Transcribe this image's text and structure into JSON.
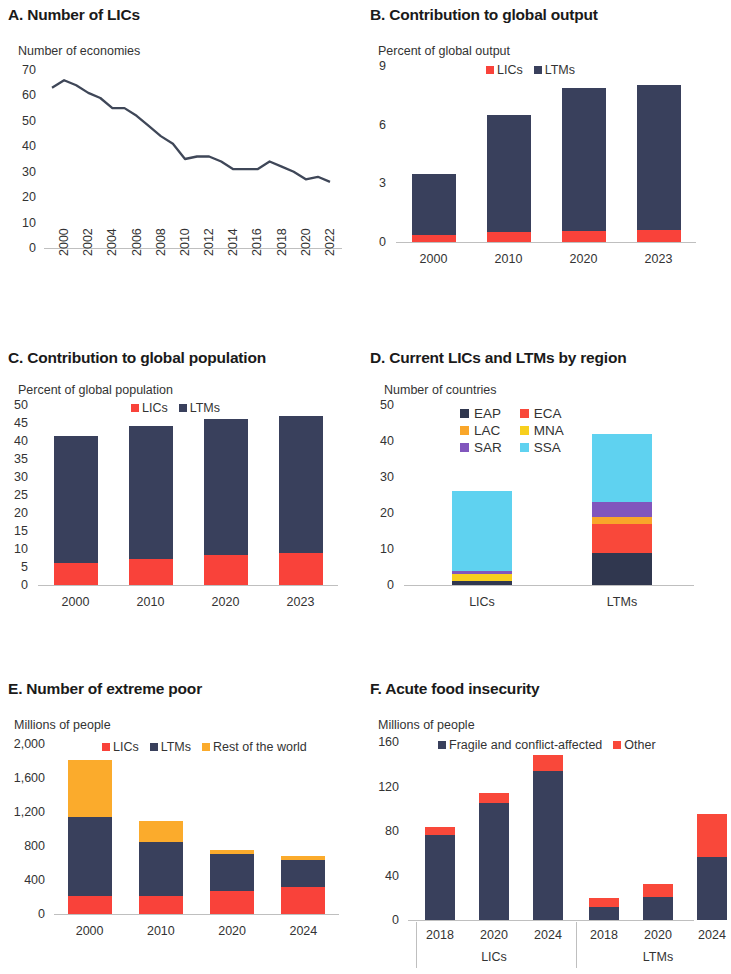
{
  "figure": {
    "colors": {
      "lics": "#f9423a",
      "ltms": "#39405c",
      "rest_of_world": "#fbab2c",
      "eap": "#30374f",
      "eca": "#f9483a",
      "lac": "#f9a62a",
      "mna": "#f7cf1e",
      "sar": "#8156bd",
      "ssa": "#5fd2f0",
      "fragile": "#39405c",
      "other": "#f9483a",
      "axis": "#bfbfbf",
      "line": "#3f4758"
    }
  },
  "panels": {
    "a": {
      "title": "A. Number of LICs",
      "axis_label": "Number of economies"
    },
    "b": {
      "title": "B. Contribution to global output",
      "axis_label": "Percent of global output"
    },
    "c": {
      "title": "C. Contribution to global population",
      "axis_label": "Percent of global population"
    },
    "d": {
      "title": "D. Current LICs and LTMs by region",
      "axis_label": "Number of countries"
    },
    "e": {
      "title": "E. Number of extreme poor",
      "axis_label": "Millions of people"
    },
    "f": {
      "title": "F. Acute food insecurity",
      "axis_label": "Millions of people"
    }
  },
  "chart_data": [
    {
      "id": "a",
      "type": "line",
      "title": "A. Number of LICs",
      "ylabel": "Number of economies",
      "xlabel": "",
      "ylim": [
        0,
        70
      ],
      "yticks": [
        0,
        10,
        20,
        30,
        40,
        50,
        60,
        70
      ],
      "ytick_labels": [
        "0",
        "10",
        "20",
        "30",
        "40",
        "50",
        "60",
        "70"
      ],
      "x": [
        2000,
        2001,
        2002,
        2003,
        2004,
        2005,
        2006,
        2007,
        2008,
        2009,
        2010,
        2011,
        2012,
        2013,
        2014,
        2015,
        2016,
        2017,
        2018,
        2019,
        2020,
        2021,
        2022,
        2023
      ],
      "xtick_labels": [
        "2000",
        "2002",
        "2004",
        "2006",
        "2008",
        "2010",
        "2012",
        "2014",
        "2016",
        "2018",
        "2020",
        "2022"
      ],
      "series": [
        {
          "name": "Number of LICs",
          "values": [
            63,
            66,
            64,
            61,
            59,
            55,
            55,
            52,
            48,
            44,
            41,
            35,
            36,
            36,
            34,
            31,
            31,
            31,
            34,
            32,
            30,
            27,
            28,
            26
          ]
        }
      ],
      "grid": false,
      "legend": "none"
    },
    {
      "id": "b",
      "type": "bar",
      "stacked": true,
      "title": "B. Contribution to global output",
      "ylabel": "Percent of global output",
      "xlabel": "",
      "ylim": [
        0,
        9
      ],
      "yticks": [
        0,
        3,
        6,
        9
      ],
      "ytick_labels": [
        "0",
        "3",
        "6",
        "9"
      ],
      "categories": [
        "2000",
        "2010",
        "2020",
        "2023"
      ],
      "series": [
        {
          "name": "LICs",
          "values": [
            0.35,
            0.5,
            0.55,
            0.6
          ]
        },
        {
          "name": "LTMs",
          "values": [
            3.15,
            6.0,
            7.35,
            7.45
          ]
        }
      ],
      "legend": [
        "LICs",
        "LTMs"
      ],
      "legend_position": "top-center",
      "grid": false
    },
    {
      "id": "c",
      "type": "bar",
      "stacked": true,
      "title": "C. Contribution to global population",
      "ylabel": "Percent of global population",
      "xlabel": "",
      "ylim": [
        0,
        50
      ],
      "yticks": [
        0,
        5,
        10,
        15,
        20,
        25,
        30,
        35,
        40,
        45,
        50
      ],
      "ytick_labels": [
        "0",
        "5",
        "10",
        "15",
        "20",
        "25",
        "30",
        "35",
        "40",
        "45",
        "50"
      ],
      "categories": [
        "2000",
        "2010",
        "2020",
        "2023"
      ],
      "series": [
        {
          "name": "LICs",
          "values": [
            6.0,
            7.2,
            8.4,
            8.8
          ]
        },
        {
          "name": "LTMs",
          "values": [
            35.5,
            37.0,
            37.8,
            38.2
          ]
        }
      ],
      "legend": [
        "LICs",
        "LTMs"
      ],
      "legend_position": "top-center",
      "grid": false
    },
    {
      "id": "d",
      "type": "bar",
      "stacked": true,
      "title": "D. Current LICs and LTMs by region",
      "ylabel": "Number of countries",
      "xlabel": "",
      "ylim": [
        0,
        50
      ],
      "yticks": [
        0,
        10,
        20,
        30,
        40,
        50
      ],
      "ytick_labels": [
        "0",
        "10",
        "20",
        "30",
        "40",
        "50"
      ],
      "categories": [
        "LICs",
        "LTMs"
      ],
      "series": [
        {
          "name": "EAP",
          "values": [
            1,
            9
          ]
        },
        {
          "name": "ECA",
          "values": [
            0,
            8
          ]
        },
        {
          "name": "LAC",
          "values": [
            0,
            2
          ]
        },
        {
          "name": "MNA",
          "values": [
            2,
            0
          ]
        },
        {
          "name": "SAR",
          "values": [
            1,
            4
          ]
        },
        {
          "name": "SSA",
          "values": [
            22,
            19
          ]
        }
      ],
      "legend": [
        "EAP",
        "ECA",
        "LAC",
        "MNA",
        "SAR",
        "SSA"
      ],
      "legend_position": "top-left-grid",
      "grid": false
    },
    {
      "id": "e",
      "type": "bar",
      "stacked": true,
      "title": "E. Number of extreme poor",
      "ylabel": "Millions of people",
      "xlabel": "",
      "ylim": [
        0,
        2000
      ],
      "yticks": [
        0,
        400,
        800,
        1200,
        1600,
        2000
      ],
      "ytick_labels": [
        "0",
        "400",
        "800",
        "1,200",
        "1,600",
        "2,000"
      ],
      "categories": [
        "2000",
        "2010",
        "2020",
        "2024"
      ],
      "series": [
        {
          "name": "LICs",
          "values": [
            215,
            215,
            265,
            315
          ]
        },
        {
          "name": "LTMs",
          "values": [
            930,
            630,
            440,
            325
          ]
        },
        {
          "name": "Rest of the world",
          "values": [
            665,
            245,
            45,
            40
          ]
        }
      ],
      "legend": [
        "LICs",
        "LTMs",
        "Rest of the world"
      ],
      "legend_position": "top-center",
      "grid": false
    },
    {
      "id": "f",
      "type": "bar",
      "stacked": true,
      "grouped": true,
      "title": "F. Acute food insecurity",
      "ylabel": "Millions of people",
      "xlabel": "",
      "ylim": [
        0,
        160
      ],
      "yticks": [
        0,
        40,
        80,
        120,
        160
      ],
      "ytick_labels": [
        "0",
        "40",
        "80",
        "120",
        "160"
      ],
      "groups": [
        "LICs",
        "LTMs"
      ],
      "categories": [
        "2018",
        "2020",
        "2024",
        "2018",
        "2020",
        "2024"
      ],
      "series": [
        {
          "name": "Fragile and conflict-affected",
          "values": [
            76,
            105,
            134,
            12,
            21,
            57
          ]
        },
        {
          "name": "Other",
          "values": [
            8,
            9,
            14,
            8,
            11,
            38
          ]
        }
      ],
      "legend": [
        "Fragile and conflict-affected",
        "Other"
      ],
      "legend_position": "top-center",
      "grid": false
    }
  ]
}
